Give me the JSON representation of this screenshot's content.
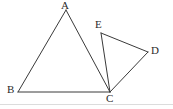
{
  "figure": {
    "type": "geometry-diagram",
    "background_color": "#ffffff",
    "stroke_color": "#3a3a3a",
    "stroke_width": 1,
    "label_color": "#2b2b2b",
    "separator_color": "#dcdcdc",
    "canvas": {
      "width": 173,
      "height": 109
    },
    "points": {
      "A": {
        "label": "A",
        "x": 66,
        "y": 10
      },
      "B": {
        "label": "B",
        "x": 18,
        "y": 92
      },
      "C": {
        "label": "C",
        "x": 110,
        "y": 92
      },
      "D": {
        "label": "D",
        "x": 148,
        "y": 52
      },
      "E": {
        "label": "E",
        "x": 101,
        "y": 33
      }
    },
    "segments": [
      {
        "name": "segment-AB",
        "from": "A",
        "to": "B",
        "x1": 66,
        "y1": 10,
        "x2": 18,
        "y2": 92
      },
      {
        "name": "segment-BC",
        "from": "B",
        "to": "C",
        "x1": 18,
        "y1": 92,
        "x2": 110,
        "y2": 92
      },
      {
        "name": "segment-AC",
        "from": "A",
        "to": "C",
        "x1": 66,
        "y1": 10,
        "x2": 110,
        "y2": 92
      },
      {
        "name": "segment-EC",
        "from": "E",
        "to": "C",
        "x1": 101,
        "y1": 33,
        "x2": 110,
        "y2": 92
      },
      {
        "name": "segment-ED",
        "from": "E",
        "to": "D",
        "x1": 101,
        "y1": 33,
        "x2": 148,
        "y2": 52
      },
      {
        "name": "segment-DC",
        "from": "D",
        "to": "C",
        "x1": 148,
        "y1": 52,
        "x2": 110,
        "y2": 92
      }
    ],
    "triangles": [
      {
        "name": "triangle-ABC",
        "vertices": "ABC"
      },
      {
        "name": "triangle-CDE",
        "vertices": "CDE"
      }
    ]
  }
}
